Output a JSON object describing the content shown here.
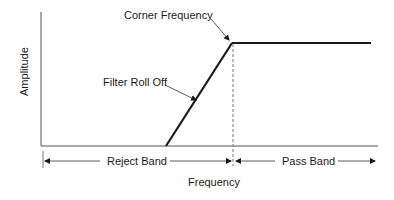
{
  "diagram": {
    "type": "filter-response",
    "title": "",
    "axes": {
      "x_label": "Frequency",
      "y_label": "Amplitude"
    },
    "annotations": {
      "corner_frequency": "Corner Frequency",
      "roll_off": "Filter Roll Off"
    },
    "bands": {
      "reject": "Reject Band",
      "pass": "Pass Band"
    },
    "colors": {
      "line": "#1a1a1a",
      "axis": "#555555",
      "background": "#ffffff"
    }
  }
}
